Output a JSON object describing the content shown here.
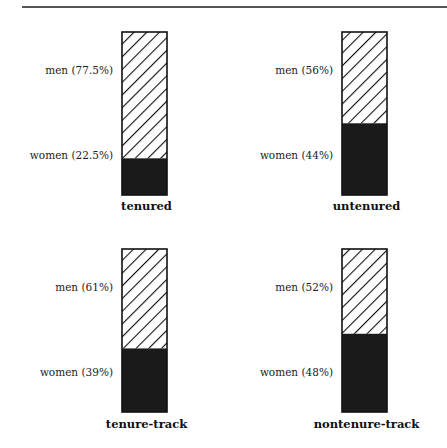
{
  "chart_data": {
    "type": "bar",
    "subtype": "stacked-100-percent",
    "title": "",
    "xlabel": "",
    "ylabel": "",
    "ylim": [
      0,
      100
    ],
    "legend": "none",
    "grid": false,
    "categories": [
      "tenured",
      "untenured",
      "tenure-track",
      "nontenure-track"
    ],
    "series": [
      {
        "name": "women",
        "fill": "solid",
        "color": "#1a1a1a",
        "values": [
          22.5,
          44,
          39,
          48
        ],
        "labels": [
          "women (22.5%)",
          "women (44%)",
          "women (39%)",
          "women (48%)"
        ]
      },
      {
        "name": "men",
        "fill": "hatched",
        "color": "#ffffff",
        "values": [
          77.5,
          56,
          61,
          52
        ],
        "labels": [
          "men (77.5%)",
          "men (56%)",
          "men (61%)",
          "men (52%)"
        ]
      }
    ]
  }
}
